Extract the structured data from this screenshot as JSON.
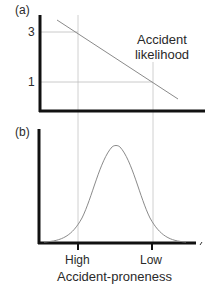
{
  "panel_a": {
    "label": "(a)",
    "y_ticks": [
      {
        "label": "3",
        "value": 3
      },
      {
        "label": "1",
        "value": 1
      }
    ],
    "curve_label_line1": "Accident",
    "curve_label_line2": "likelihood"
  },
  "panel_b": {
    "label": "(b)"
  },
  "x_axis": {
    "ticks": [
      {
        "label": "High"
      },
      {
        "label": "Low"
      }
    ],
    "title": "Accident-proneness"
  },
  "colors": {
    "axis": "#111111",
    "line": "#8a8a8a",
    "guide": "#bdbdbd",
    "text": "#2a2a2a"
  }
}
